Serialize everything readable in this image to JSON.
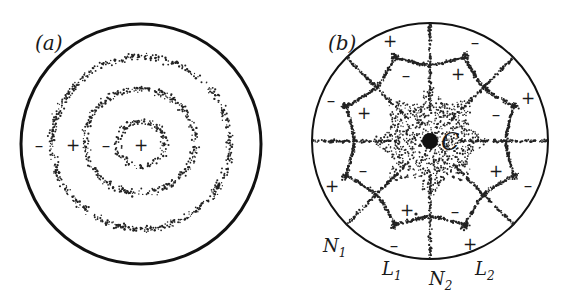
{
  "panel_a": {
    "label": "(a)",
    "outer_circle": {
      "cx": 141,
      "cy": 144,
      "r": 120
    },
    "rings": [
      {
        "cx": 141,
        "cy": 144,
        "rx": 24,
        "ry": 22
      },
      {
        "cx": 140,
        "cy": 141,
        "rx": 55,
        "ry": 52
      },
      {
        "cx": 141,
        "cy": 143,
        "rx": 89,
        "ry": 86
      }
    ],
    "signs": [
      {
        "text": "-",
        "x": 39,
        "y": 145
      },
      {
        "text": "+",
        "x": 73,
        "y": 145
      },
      {
        "text": "-",
        "x": 106,
        "y": 145
      },
      {
        "text": "+",
        "x": 141,
        "y": 145
      }
    ]
  },
  "panel_b": {
    "label": "(b)",
    "outer_circle": {
      "cx": 430,
      "cy": 141,
      "r": 118
    },
    "center_label": "C",
    "center_dot": {
      "cx": 430,
      "cy": 141,
      "r": 8
    },
    "signs": [
      {
        "text": "+",
        "x": 390,
        "y": 41
      },
      {
        "text": "-",
        "x": 475,
        "y": 42
      },
      {
        "text": "-",
        "x": 406,
        "y": 75
      },
      {
        "text": "+",
        "x": 458,
        "y": 74
      },
      {
        "text": "-",
        "x": 331,
        "y": 100
      },
      {
        "text": "+",
        "x": 364,
        "y": 113
      },
      {
        "text": "+",
        "x": 528,
        "y": 98
      },
      {
        "text": "-",
        "x": 496,
        "y": 114
      },
      {
        "text": "-",
        "x": 363,
        "y": 170
      },
      {
        "text": "+",
        "x": 496,
        "y": 171
      },
      {
        "text": "+",
        "x": 332,
        "y": 186
      },
      {
        "text": "-",
        "x": 528,
        "y": 185
      },
      {
        "text": "+",
        "x": 407,
        "y": 210
      },
      {
        "text": "-",
        "x": 455,
        "y": 211
      },
      {
        "text": "-",
        "x": 394,
        "y": 245
      },
      {
        "text": "+",
        "x": 470,
        "y": 244
      }
    ],
    "node_labels": [
      {
        "text": "N",
        "sub": "1",
        "x": 323,
        "y": 252
      },
      {
        "text": "L",
        "sub": "1",
        "x": 382,
        "y": 275
      },
      {
        "text": "N",
        "sub": "2",
        "x": 429,
        "y": 285
      },
      {
        "text": "L",
        "sub": "2",
        "x": 475,
        "y": 275
      }
    ]
  }
}
